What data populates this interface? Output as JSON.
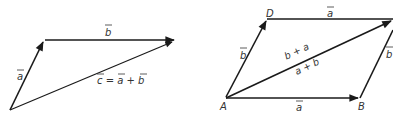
{
  "left_figure": {
    "vectors": [
      {
        "id": "a",
        "label": "a",
        "from": [
          10,
          110
        ],
        "to": [
          44,
          40
        ]
      },
      {
        "id": "b",
        "label": "b",
        "from": [
          44,
          40
        ],
        "to": [
          175,
          40
        ]
      },
      {
        "id": "c",
        "label": "c = a + b",
        "from": [
          10,
          110
        ],
        "to": [
          175,
          40
        ]
      }
    ],
    "labels": {
      "a": "a",
      "b": "b",
      "c_eq": "c = a + b"
    }
  },
  "right_figure": {
    "points": {
      "A": {
        "label": "A",
        "xy": [
          225,
          98
        ]
      },
      "B": {
        "label": "B",
        "xy": [
          360,
          98
        ]
      },
      "D": {
        "label": "D",
        "xy": [
          267,
          19
        ]
      },
      "C": {
        "label": "",
        "xy": [
          393,
          19
        ]
      }
    },
    "labels": {
      "A": "A",
      "B": "B",
      "D": "D",
      "top_a": "a",
      "bottom_a": "a",
      "left_b": "b",
      "right_b": "b",
      "diag_upper": "b + a",
      "diag_lower": "a + b"
    }
  },
  "colors": {
    "line": "#1a1a1a",
    "text": "#333333",
    "background": "#ffffff"
  }
}
